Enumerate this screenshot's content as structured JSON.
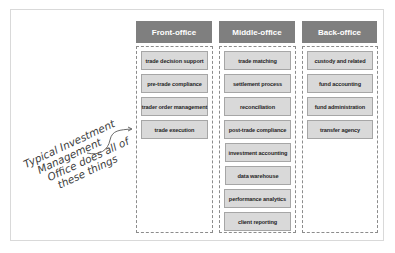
{
  "diagram": {
    "columns": [
      {
        "header": "Front-office",
        "items": [
          "trade decision support",
          "pre-trade compliance",
          "trader order management",
          "trade execution"
        ]
      },
      {
        "header": "Middle-office",
        "items": [
          "trade matching",
          "settlement process",
          "reconciliation",
          "post-trade compliance",
          "investment accounting",
          "data warehouse",
          "performance analytics",
          "client reporting"
        ]
      },
      {
        "header": "Back-office",
        "items": [
          "custody and related",
          "fund accounting",
          "fund administration",
          "transfer agency"
        ]
      }
    ],
    "annotation": {
      "lines": [
        "Typical Investment",
        "Management",
        "Office does all of",
        "these things"
      ]
    },
    "colors": {
      "header_bg": "#7f7f7f",
      "header_text": "#ffffff",
      "item_bg": "#d9d9d9",
      "item_border": "#a6a6a6",
      "dashed_border": "#8c8c8c"
    }
  }
}
